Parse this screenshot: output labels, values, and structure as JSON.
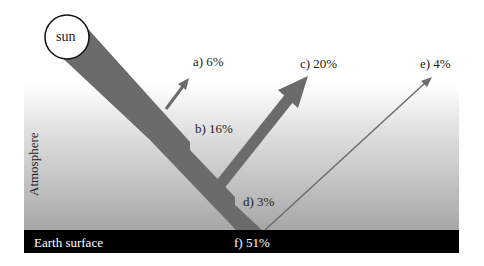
{
  "diagram": {
    "title": "",
    "sun": {
      "label": "sun"
    },
    "atmosphere": {
      "label": "Atmosphere"
    },
    "earth": {
      "label": "Earth surface"
    },
    "fluxes": [
      {
        "id": "a",
        "label": "a) 6%"
      },
      {
        "id": "b",
        "label": "b) 16%"
      },
      {
        "id": "c",
        "label": "c) 20%"
      },
      {
        "id": "d",
        "label": "d) 3%"
      },
      {
        "id": "e",
        "label": "e) 4%"
      },
      {
        "id": "f",
        "label": "f) 51%"
      }
    ],
    "colors": {
      "band": "#6b6b6b",
      "atmosphere_top": "#ffffff",
      "atmosphere_bottom": "#a8a8a8",
      "earth": "#000000",
      "sun_fill": "#ffffff",
      "sun_stroke": "#111111"
    }
  }
}
